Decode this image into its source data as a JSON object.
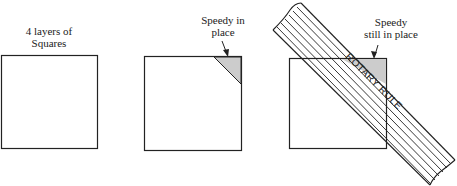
{
  "panels": [
    {
      "label_line1": "4 layers of",
      "label_line2": "Squares"
    },
    {
      "label_line1": "Speedy in",
      "label_line2": "place"
    },
    {
      "label_line1": "Speedy",
      "label_line2": "still in place"
    }
  ],
  "rule_text": "ROTARY RULE",
  "colors": {
    "stroke": "#222222",
    "shade": "#cccccc",
    "background": "#ffffff"
  }
}
